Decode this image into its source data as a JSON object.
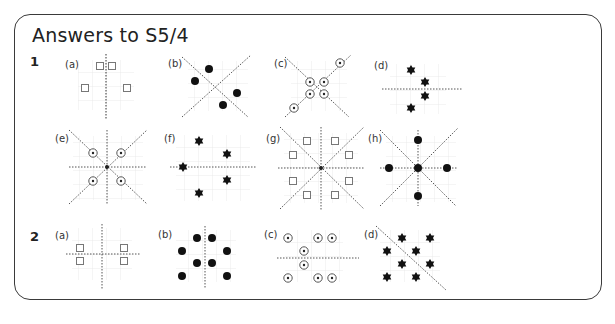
{
  "title": "Answers to S5/4",
  "colors": {
    "border": "#3a3a3a",
    "grid": "#e6e6e6",
    "line": "#555555",
    "shape": "#111111",
    "square": "#777777"
  },
  "questions": [
    {
      "number": "1",
      "parts": [
        {
          "label": "(a)",
          "shape": "square",
          "lines": [
            "vertical"
          ],
          "description": "four squares, vertical line of symmetry"
        },
        {
          "label": "(b)",
          "shape": "dot",
          "lines": [
            "diagonal",
            "anti-diagonal"
          ],
          "description": "four dots, two diagonal lines of symmetry"
        },
        {
          "label": "(c)",
          "shape": "ringed-dot",
          "lines": [
            "diagonal",
            "anti-diagonal"
          ],
          "description": "six ringed dots, two diagonal lines of symmetry"
        },
        {
          "label": "(d)",
          "shape": "star",
          "lines": [
            "horizontal"
          ],
          "description": "four stars, horizontal line of symmetry"
        },
        {
          "label": "(e)",
          "shape": "ringed-dot",
          "lines": [
            "vertical",
            "horizontal",
            "diagonal",
            "anti-diagonal"
          ],
          "description": "four ringed dots, four lines of symmetry"
        },
        {
          "label": "(f)",
          "shape": "star",
          "lines": [
            "horizontal"
          ],
          "description": "five stars, horizontal line of symmetry"
        },
        {
          "label": "(g)",
          "shape": "square",
          "lines": [
            "vertical",
            "horizontal",
            "diagonal",
            "anti-diagonal"
          ],
          "description": "eight squares, four lines of symmetry"
        },
        {
          "label": "(h)",
          "shape": "dot",
          "lines": [
            "vertical",
            "horizontal",
            "diagonal",
            "anti-diagonal"
          ],
          "description": "five dots, four lines of symmetry"
        }
      ]
    },
    {
      "number": "2",
      "parts": [
        {
          "label": "(a)",
          "shape": "square",
          "lines": [
            "vertical",
            "horizontal"
          ],
          "description": "four squares, two lines of symmetry"
        },
        {
          "label": "(b)",
          "shape": "dot",
          "lines": [
            "vertical"
          ],
          "description": "eight dots, vertical line of symmetry"
        },
        {
          "label": "(c)",
          "shape": "ringed-dot",
          "lines": [
            "horizontal"
          ],
          "description": "eight ringed dots, horizontal line of symmetry"
        },
        {
          "label": "(d)",
          "shape": "star",
          "lines": [
            "anti-diagonal"
          ],
          "description": "eight stars, diagonal line of symmetry"
        }
      ]
    }
  ]
}
